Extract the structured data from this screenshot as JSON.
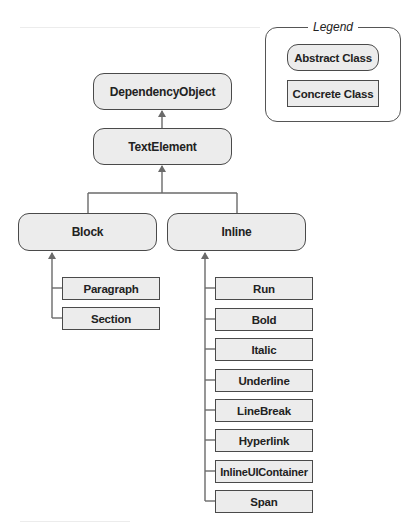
{
  "legend": {
    "title": "Legend",
    "abstract_label": "Abstract Class",
    "concrete_label": "Concrete Class"
  },
  "nodes": {
    "dependency_object": "DependencyObject",
    "text_element": "TextElement",
    "block": "Block",
    "inline": "Inline"
  },
  "block_children": [
    "Paragraph",
    "Section"
  ],
  "inline_children": [
    "Run",
    "Bold",
    "Italic",
    "Underline",
    "LineBreak",
    "Hyperlink",
    "InlineUIContainer",
    "Span"
  ],
  "colors": {
    "node_fill": "#ececec",
    "node_border": "#4a4a4a",
    "connector": "#6a6a6a"
  }
}
